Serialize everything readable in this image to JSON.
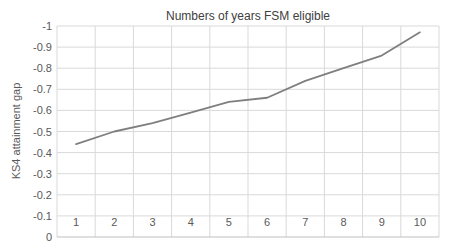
{
  "chart_data": {
    "type": "line",
    "title": "Numbers of years FSM eligible",
    "xlabel": "",
    "ylabel": "KS4 attainment gap",
    "categories": [
      "1",
      "2",
      "3",
      "4",
      "5",
      "6",
      "7",
      "8",
      "9",
      "10"
    ],
    "series": [
      {
        "name": "KS4 attainment gap",
        "values": [
          -0.44,
          -0.5,
          -0.54,
          -0.59,
          -0.64,
          -0.66,
          -0.74,
          -0.8,
          -0.86,
          -0.97
        ]
      }
    ],
    "ylim": [
      0,
      -1
    ],
    "y_axis_reversed": true,
    "y_ticks": [
      "-1",
      "-0.9",
      "-0.8",
      "-0.7",
      "-0.6",
      "-0.5",
      "-0.4",
      "-0.3",
      "-0.2",
      "-0.1",
      "0"
    ],
    "grid": true,
    "legend_position": "none",
    "colors": {
      "line": "#7f7f7f",
      "grid": "#d9d9d9",
      "axis": "#bfbfbf",
      "tick_text": "#595959",
      "title_text": "#404040",
      "background": "#ffffff"
    }
  }
}
